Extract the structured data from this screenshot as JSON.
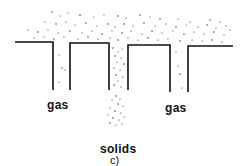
{
  "diagram": {
    "panel_label": "c)",
    "labels": {
      "gas_left": "gas",
      "gas_right": "gas",
      "solids": "solids"
    },
    "colors": {
      "ink": "#111111",
      "background": "#ffffff"
    }
  }
}
